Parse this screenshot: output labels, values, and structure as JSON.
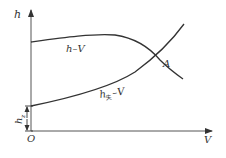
{
  "diagram": {
    "axes": {
      "y_label": "h",
      "x_label": "V",
      "origin_label": "O"
    },
    "curves": [
      {
        "name": "pump-curve",
        "label": "h–V"
      },
      {
        "name": "pipe-curve",
        "label_main": "h",
        "label_sub": "失",
        "label_suffix": "–V"
      }
    ],
    "intersection_label": "A",
    "offset_label_main": "h",
    "offset_label_sub": "z",
    "colors": {
      "line": "#333333",
      "axis": "#555555"
    }
  }
}
